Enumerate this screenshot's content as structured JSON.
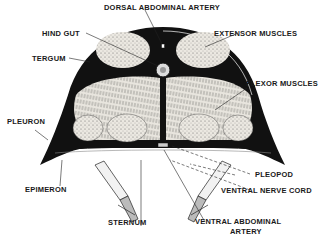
{
  "figure": {
    "colors": {
      "ink": "#111111",
      "muscle_fill": "#e6e3dc",
      "background": "#ffffff"
    },
    "labels": {
      "dorsal_abdominal_artery": "DORSAL ABDOMINAL ARTERY",
      "hind_gut": "HIND GUT",
      "extensor_muscles": "EXTENSOR MUSCLES",
      "tergum": "TERGUM",
      "flexor_muscles": "FLEXOR MUSCLES",
      "pleuron": "PLEURON",
      "pleopod": "PLEOPOD",
      "epimeron": "EPIMERON",
      "ventral_nerve_cord": "VENTRAL NERVE CORD",
      "sternum": "STERNUM",
      "ventral_abdominal_artery_line1": "VENTRAL ABDOMINAL",
      "ventral_abdominal_artery_line2": "ARTERY"
    }
  }
}
